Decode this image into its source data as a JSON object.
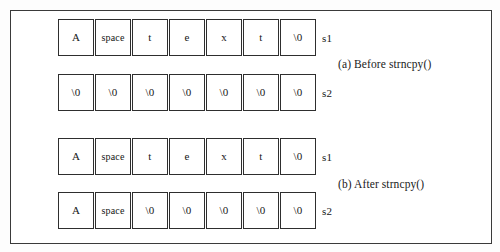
{
  "figure": {
    "frame_color": "#3a3a3a",
    "cell_border_color": "#2e2e2e",
    "background_color": "#ffffff",
    "rows": [
      {
        "label": "s1",
        "cells": [
          "A",
          "space",
          "t",
          "e",
          "x",
          "t",
          "\\0"
        ]
      },
      {
        "label": "s2",
        "cells": [
          "\\0",
          "\\0",
          "\\0",
          "\\0",
          "\\0",
          "\\0",
          "\\0"
        ]
      },
      {
        "label": "s1",
        "cells": [
          "A",
          "space",
          "t",
          "e",
          "x",
          "t",
          "\\0"
        ]
      },
      {
        "label": "s2",
        "cells": [
          "A",
          "space",
          "\\0",
          "\\0",
          "\\0",
          "\\0",
          "\\0"
        ]
      }
    ],
    "captions": [
      "(a) Before strncpy()",
      "(b) After strncpy()"
    ]
  }
}
